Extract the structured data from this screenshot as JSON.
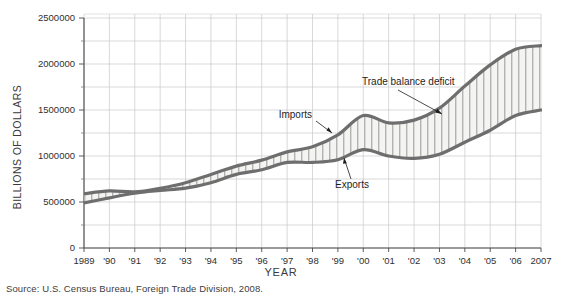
{
  "figure": {
    "source_note": "Source: U.S. Census Bureau, Foreign Trade Division, 2008.",
    "y_axis_title": "BILLIONS OF DOLLARS",
    "x_axis_title": "YEAR"
  },
  "annotations": {
    "imports": "Imports",
    "exports": "Exports",
    "deficit": "Trade balance deficit"
  },
  "colors": {
    "line": "#6e6e6e",
    "grid": "#c9c9c9",
    "axis": "#4a4a4a",
    "hatch": "#8a8a8a",
    "band_fill": "#f2f2f0",
    "text": "#2b2b2b"
  },
  "chart_data": {
    "type": "area",
    "title": "",
    "subtitle": "",
    "xlabel": "YEAR",
    "ylabel": "BILLIONS OF DOLLARS",
    "xlim": [
      1989,
      2007
    ],
    "ylim": [
      0,
      2500000
    ],
    "grid": true,
    "legend_position": "inline-annotations",
    "y_ticks": [
      0,
      500000,
      1000000,
      1500000,
      2000000,
      2500000
    ],
    "y_tick_labels": [
      "0",
      "500000",
      "1000000",
      "1500000",
      "2000000",
      "2500000"
    ],
    "y_minor_ticks": [
      250000,
      750000,
      1250000,
      1750000,
      2250000
    ],
    "x": [
      1989,
      1990,
      1991,
      1992,
      1993,
      1994,
      1995,
      1996,
      1997,
      1998,
      1999,
      2000,
      2001,
      2002,
      2003,
      2004,
      2005,
      2006,
      2007
    ],
    "x_tick_labels": [
      "1989",
      "'90",
      "'91",
      "'92",
      "'93",
      "'94",
      "'95",
      "'96",
      "'97",
      "'98",
      "'99",
      "'00",
      "'01",
      "'02",
      "'03",
      "'04",
      "'05",
      "'06",
      "2007"
    ],
    "series": [
      {
        "name": "Imports",
        "values": [
          590000,
          620000,
          610000,
          650000,
          710000,
          800000,
          890000,
          955000,
          1045000,
          1100000,
          1230000,
          1440000,
          1360000,
          1390000,
          1520000,
          1760000,
          1990000,
          2160000,
          2200000
        ]
      },
      {
        "name": "Exports",
        "values": [
          490000,
          545000,
          595000,
          625000,
          650000,
          710000,
          800000,
          850000,
          930000,
          930000,
          960000,
          1070000,
          1000000,
          975000,
          1020000,
          1150000,
          1280000,
          1440000,
          1500000
        ]
      }
    ],
    "shaded_region": {
      "label": "Trade balance deficit",
      "between": [
        "Exports",
        "Imports"
      ],
      "hatch": "vertical-lines"
    }
  }
}
